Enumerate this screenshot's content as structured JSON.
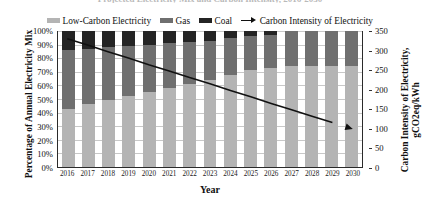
{
  "clipped_title": "Projected Electricity Mix and Carbon Intensity, 2016-2030",
  "legend": {
    "items": [
      {
        "label": "Low-Carbon Electricity",
        "color": "#b4b4b4",
        "marker": "swatch",
        "icon": "legend-swatch-icon"
      },
      {
        "label": "Gas",
        "color": "#6f6f6f",
        "marker": "swatch",
        "icon": "legend-swatch-icon"
      },
      {
        "label": "Coal",
        "color": "#242424",
        "marker": "swatch",
        "icon": "legend-swatch-icon"
      },
      {
        "label": "Carbon Intensity of Electricity",
        "color": "#111111",
        "marker": "line-arrow",
        "icon": "legend-line-arrow-icon"
      }
    ]
  },
  "axes": {
    "x_title": "Year",
    "y_left_title": "Percentage of Annual Electricity Mix",
    "y_right_title": "Carbon Intensity of Electricity, gCO2eq/kWh",
    "y_left_ticks": [
      "0%",
      "10%",
      "20%",
      "30%",
      "40%",
      "50%",
      "60%",
      "70%",
      "80%",
      "90%",
      "100%"
    ],
    "y_right_ticks": [
      "0",
      "50",
      "100",
      "150",
      "200",
      "250",
      "300",
      "350"
    ]
  },
  "chart_data": {
    "type": "bar",
    "title": "Projected Electricity Mix and Carbon Intensity, 2016-2030",
    "xlabel": "Year",
    "ylabel": "Percentage of Annual Electricity Mix",
    "y2label": "Carbon Intensity of Electricity, gCO2eq/kWh",
    "ylim": [
      0,
      100
    ],
    "y2lim": [
      0,
      350
    ],
    "grid": true,
    "legend_position": "top",
    "stacked": true,
    "categories": [
      "2016",
      "2017",
      "2018",
      "2019",
      "2020",
      "2021",
      "2022",
      "2023",
      "2024",
      "2025",
      "2026",
      "2027",
      "2028",
      "2029",
      "2030"
    ],
    "series": [
      {
        "name": "Low-Carbon Electricity",
        "color": "#b4b4b4",
        "values": [
          43,
          46,
          49,
          52,
          55,
          58,
          61,
          64,
          68,
          71,
          73,
          74,
          74,
          74,
          74
        ]
      },
      {
        "name": "Gas",
        "color": "#6f6f6f",
        "values": [
          43,
          41,
          39,
          37,
          35,
          33,
          31,
          29,
          27,
          25,
          24,
          26,
          26,
          26,
          26
        ]
      },
      {
        "name": "Coal",
        "color": "#242424",
        "values": [
          14,
          13,
          12,
          11,
          10,
          9,
          8,
          7,
          5,
          4,
          3,
          0,
          0,
          0,
          0
        ]
      }
    ],
    "line_series": {
      "name": "Carbon Intensity of Electricity",
      "color": "#111111",
      "axis": "y2",
      "unit": "gCO2eq/kWh",
      "values": [
        330,
        314,
        297,
        281,
        264,
        248,
        231,
        215,
        198,
        182,
        165,
        149,
        132,
        116,
        100
      ]
    }
  }
}
